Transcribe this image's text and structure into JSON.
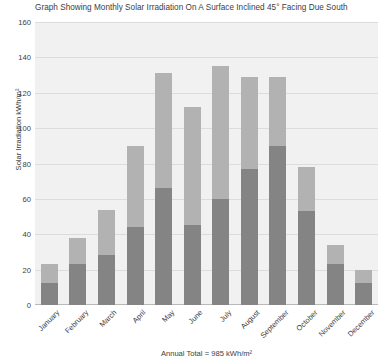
{
  "chart_data": {
    "type": "bar",
    "title": "Graph Showing Monthly Solar Irradiation On A Surface Inclined 45° Facing Due South",
    "xlabel": "",
    "ylabel": "Solar Irradiation kWh/m²",
    "ylim": [
      0,
      160
    ],
    "ytick_step": 20,
    "yticks": [
      160,
      140,
      120,
      100,
      80,
      60,
      40,
      20,
      0
    ],
    "grid": true,
    "legend": "none",
    "stacked": true,
    "categories": [
      "January",
      "February",
      "March",
      "April",
      "May",
      "June",
      "July",
      "August",
      "September",
      "October",
      "November",
      "December"
    ],
    "series": [
      {
        "name": "Lower segment",
        "color": "#848484",
        "values": [
          12.5,
          23,
          28,
          44,
          66,
          45,
          60,
          77,
          90,
          53,
          23,
          12.5
        ]
      },
      {
        "name": "Upper segment",
        "color": "#b2b2b2",
        "values": [
          10.5,
          15,
          26,
          46,
          65,
          67,
          75,
          52,
          39,
          25,
          11,
          7.5
        ]
      }
    ],
    "totals": [
      23,
      38,
      54,
      90,
      131,
      112,
      135,
      129,
      129,
      78,
      34,
      20
    ],
    "annotation": "Annual Total = 985 kWh/m²",
    "plot_background": "#f1f1f1",
    "gridline_color": "#dcdcdc"
  }
}
